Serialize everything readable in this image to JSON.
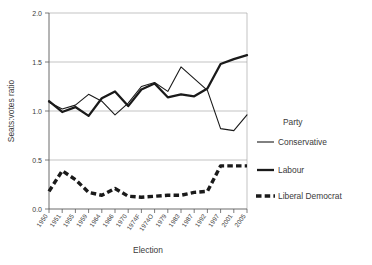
{
  "chart_data": {
    "type": "line",
    "title": "",
    "xlabel": "Election",
    "ylabel": "Seats:votes ratio",
    "ylim": [
      0.0,
      2.0
    ],
    "yticks": [
      "0.0",
      "0.5",
      "1.0",
      "1.5",
      "2.0"
    ],
    "ytick_values": [
      0.0,
      0.5,
      1.0,
      1.5,
      2.0
    ],
    "grid": "horizontal",
    "legend_position": "right",
    "legend_title": "Party",
    "categories": [
      "1950",
      "1951",
      "1955",
      "1959",
      "1964",
      "1966",
      "1970",
      "1974F",
      "1974O",
      "1979",
      "1983",
      "1987",
      "1992",
      "1997",
      "2001",
      "2005"
    ],
    "series": [
      {
        "name": "Conservative",
        "style": "thin-solid",
        "color": "#1a1a1a",
        "values": [
          1.09,
          1.02,
          1.06,
          1.17,
          1.1,
          0.96,
          1.08,
          1.25,
          1.29,
          1.2,
          1.45,
          1.33,
          1.21,
          0.82,
          0.8,
          0.96
        ]
      },
      {
        "name": "Labour",
        "style": "thick-solid",
        "color": "#1a1a1a",
        "values": [
          1.1,
          0.99,
          1.04,
          0.95,
          1.13,
          1.2,
          1.05,
          1.22,
          1.28,
          1.14,
          1.17,
          1.15,
          1.23,
          1.48,
          1.53,
          1.57
        ]
      },
      {
        "name": "Liberal Democrat",
        "style": "thick-dashed",
        "color": "#1a1a1a",
        "values": [
          0.18,
          0.39,
          0.3,
          0.17,
          0.14,
          0.21,
          0.13,
          0.12,
          0.13,
          0.14,
          0.14,
          0.17,
          0.18,
          0.44,
          0.44,
          0.44
        ]
      }
    ]
  },
  "legend": {
    "title": "Party",
    "entries": [
      {
        "label": "Conservative",
        "style": "thin-solid"
      },
      {
        "label": "Labour",
        "style": "thick-solid"
      },
      {
        "label": "Liberal Democrat",
        "style": "thick-dashed"
      }
    ]
  },
  "axes": {
    "y_title": "Seats:votes ratio",
    "x_title": "Election",
    "y_tick_labels": [
      "2.0",
      "1.5",
      "1.0",
      "0.5",
      "0.0"
    ],
    "x_tick_labels": [
      "1950",
      "1951",
      "1955",
      "1959",
      "1964",
      "1966",
      "1970",
      "1974F",
      "1974O",
      "1979",
      "1983",
      "1987",
      "1992",
      "1997",
      "2001",
      "2005"
    ]
  }
}
